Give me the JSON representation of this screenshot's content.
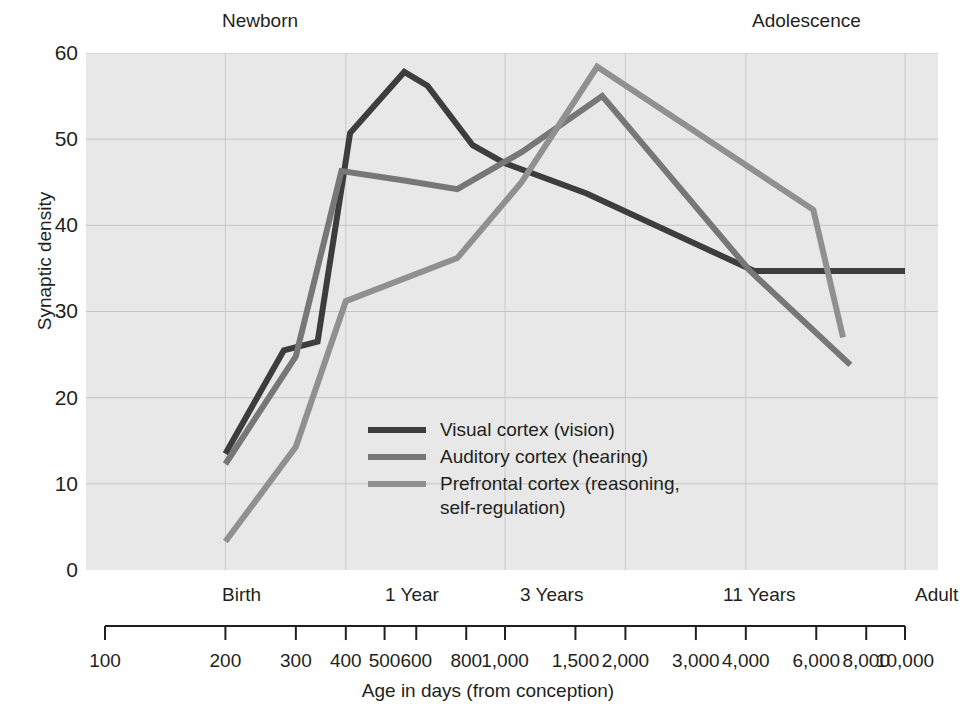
{
  "chart_data": {
    "type": "line",
    "title": "",
    "xlabel": "Age in days (from conception)",
    "ylabel": "Synaptic density",
    "xscale": "log",
    "xlim": [
      100,
      10000
    ],
    "ylim": [
      0,
      60
    ],
    "yticks": [
      0,
      10,
      20,
      30,
      40,
      50,
      60
    ],
    "xticks": [
      100,
      200,
      300,
      400,
      500,
      600,
      800,
      1000,
      1500,
      2000,
      3000,
      4000,
      6000,
      8000,
      10000
    ],
    "xtick_labels": [
      "100",
      "200",
      "300",
      "400",
      "500",
      "600",
      "800",
      "1,000",
      "1,500",
      "2,000",
      "3,000",
      "4,000",
      "6,000",
      "8,000",
      "10,000"
    ],
    "grid": true,
    "legend_position": "center-left",
    "era_annotations": [
      {
        "label": "Newborn",
        "position": "top-left"
      },
      {
        "label": "Adolescence",
        "position": "top-right"
      }
    ],
    "stage_annotations": [
      {
        "label": "Birth",
        "x": 265
      },
      {
        "label": "1 Year",
        "x": 640
      },
      {
        "label": "3 Years",
        "x": 1300
      },
      {
        "label": "11 Years",
        "x": 4300
      },
      {
        "label": "Adult",
        "x": 10000
      }
    ],
    "series": [
      {
        "name": "Visual cortex (vision)",
        "color": "#3d3d3d",
        "points": [
          [
            200,
            13.5
          ],
          [
            280,
            25.5
          ],
          [
            340,
            26.5
          ],
          [
            410,
            50.7
          ],
          [
            560,
            57.8
          ],
          [
            640,
            56.2
          ],
          [
            830,
            49.3
          ],
          [
            1000,
            47.2
          ],
          [
            1600,
            43.7
          ],
          [
            4200,
            34.7
          ],
          [
            6200,
            34.7
          ],
          [
            10000,
            34.7
          ]
        ]
      },
      {
        "name": "Auditory cortex (hearing)",
        "color": "#777777",
        "points": [
          [
            200,
            12.3
          ],
          [
            300,
            24.8
          ],
          [
            390,
            46.3
          ],
          [
            560,
            45.2
          ],
          [
            760,
            44.2
          ],
          [
            1100,
            48.5
          ],
          [
            1750,
            55.0
          ],
          [
            4100,
            34.7
          ],
          [
            7300,
            23.8
          ]
        ]
      },
      {
        "name": "Prefrontal cortex (reasoning, self-regulation)",
        "color": "#909090",
        "points": [
          [
            200,
            3.3
          ],
          [
            300,
            14.3
          ],
          [
            400,
            31.2
          ],
          [
            760,
            36.2
          ],
          [
            1100,
            45.0
          ],
          [
            1700,
            58.4
          ],
          [
            5900,
            41.8
          ],
          [
            7000,
            27.0
          ]
        ]
      }
    ]
  },
  "legend": {
    "items": [
      {
        "label": "Visual cortex (vision)",
        "color": "#3d3d3d"
      },
      {
        "label": "Auditory cortex (hearing)",
        "color": "#777777"
      },
      {
        "label": "Prefrontal cortex (reasoning,",
        "label2": "self-regulation)",
        "color": "#909090"
      }
    ]
  },
  "axes": {
    "y_title": "Synaptic density",
    "x_title": "Age in days (from conception)",
    "ytick_0": "0",
    "ytick_10": "10",
    "ytick_20": "20",
    "ytick_30": "30",
    "ytick_40": "40",
    "ytick_50": "50",
    "ytick_60": "60"
  },
  "eras": {
    "newborn": "Newborn",
    "adolescence": "Adolescence"
  },
  "stages": {
    "birth": "Birth",
    "one_year": "1 Year",
    "three_years": "3 Years",
    "eleven_years": "11 Years",
    "adult": "Adult"
  },
  "xtick_labels": {
    "t100": "100",
    "t200": "200",
    "t300": "300",
    "t400": "400",
    "t500": "500",
    "t600": "600",
    "t800": "800",
    "t1000": "1,000",
    "t1500": "1,500",
    "t2000": "2,000",
    "t3000": "3,000",
    "t4000": "4,000",
    "t6000": "6,000",
    "t8000": "8,000",
    "t10000": "10,000"
  }
}
